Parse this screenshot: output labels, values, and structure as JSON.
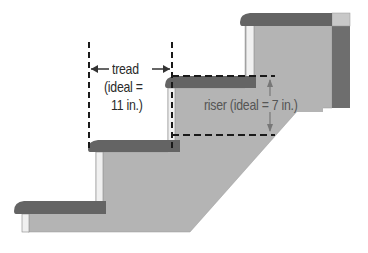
{
  "diagram": {
    "type": "stair-dimension-illustration",
    "labels": {
      "tread_line1": "tread",
      "tread_line2": "(ideal =",
      "tread_line3": "11 in.)",
      "riser": "riser (ideal = 7 in.)"
    },
    "colors": {
      "stringer": "#b4b4b4",
      "tread": "#666666",
      "riser_board": "#f2f2f2",
      "post": "#707070",
      "dimension_lines": "#1a1a1a",
      "background": "#ffffff"
    },
    "parts": [
      "tread-1",
      "tread-2",
      "tread-3",
      "tread-4",
      "stringer",
      "landing-post",
      "tread-dimension",
      "riser-dimension"
    ]
  }
}
